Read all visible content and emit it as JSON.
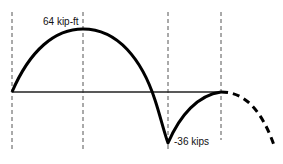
{
  "diagram": {
    "type": "moment diagram",
    "labels": {
      "max_moment": "64 kip-ft",
      "min_moment": "-36 kips"
    },
    "colors": {
      "curve": "#000000",
      "baseline": "#222222",
      "guides": "#555555",
      "background": "#ffffff"
    },
    "guide_lines_x": [
      12,
      83,
      168,
      221
    ],
    "baseline_y": 92,
    "key_points": [
      {
        "name": "start",
        "x": 12,
        "y": 92
      },
      {
        "name": "peak",
        "x": 83,
        "y": 29,
        "value": "64 kip-ft"
      },
      {
        "name": "valley",
        "x": 168,
        "y": 143,
        "value": "-36 kips"
      },
      {
        "name": "return",
        "x": 221,
        "y": 92
      },
      {
        "name": "dashed-end",
        "x": 275,
        "y": 148
      }
    ]
  }
}
